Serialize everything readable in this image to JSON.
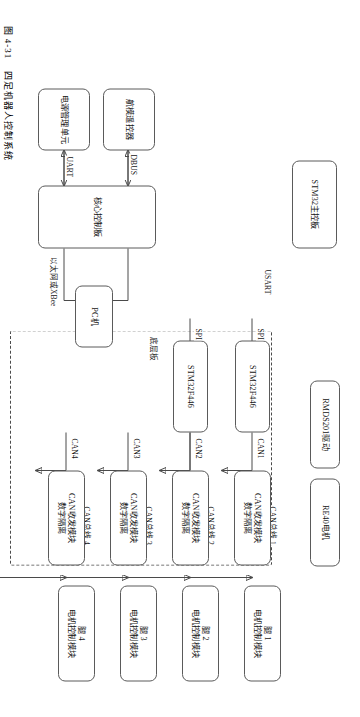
{
  "figure": {
    "caption_number": "图 4-31",
    "caption_text": "四足机器人控制系统",
    "title": "四足机器人控制系统"
  },
  "diagram": {
    "type": "block-diagram",
    "orientation": "rotated-90-landscape",
    "leg_modules": [
      {
        "id": "leg1",
        "line1": "腿 1",
        "line2": "电机控制模块"
      },
      {
        "id": "leg2",
        "line1": "腿 2",
        "line2": "电机控制模块"
      },
      {
        "id": "leg3",
        "line1": "腿 3",
        "line2": "电机控制模块"
      },
      {
        "id": "leg4",
        "line1": "腿 4",
        "line2": "电机控制模块"
      }
    ],
    "can_bus_labels": [
      "CAN总线 1",
      "CAN总线 2",
      "CAN总线 3",
      "CAN总线 4"
    ],
    "can_transceivers": [
      {
        "id": "ct1",
        "line1": "CAN收发模块",
        "line2": "数字隔离"
      },
      {
        "id": "ct2",
        "line1": "CAN收发模块",
        "line2": "数字隔离"
      },
      {
        "id": "ct3",
        "line1": "CAN收发模块",
        "line2": "数字隔离"
      },
      {
        "id": "ct4",
        "line1": "CAN收发模块",
        "line2": "数字隔离"
      }
    ],
    "can_port_labels": [
      "CAN1",
      "CAN2",
      "CAN3",
      "CAN4"
    ],
    "mcus": [
      {
        "id": "mcu1",
        "label": "STM32F446"
      },
      {
        "id": "mcu2",
        "label": "STM32F446"
      }
    ],
    "bottom_board_label": "底层板",
    "spi_labels": [
      "SPI",
      "SPI"
    ],
    "aside_blocks": [
      {
        "id": "re40",
        "label": "RE40电机"
      },
      {
        "id": "rmds",
        "label": "RMDS201驱动"
      }
    ],
    "stm32_main_board": "STM32主控板",
    "usart_label": "USART",
    "core_control_board": "核心控制板",
    "rc_transmitter": "航模遥控器",
    "dbus_label": "DBUS",
    "power_unit": "电源管理单元",
    "uart_label": "UART",
    "pc": "PC机",
    "ethernet_label": "以太网或XBee"
  },
  "colors": {
    "stroke": "#4a4a4a",
    "box_border": "#5a5a5a",
    "text": "#141414",
    "background": "#ffffff"
  }
}
